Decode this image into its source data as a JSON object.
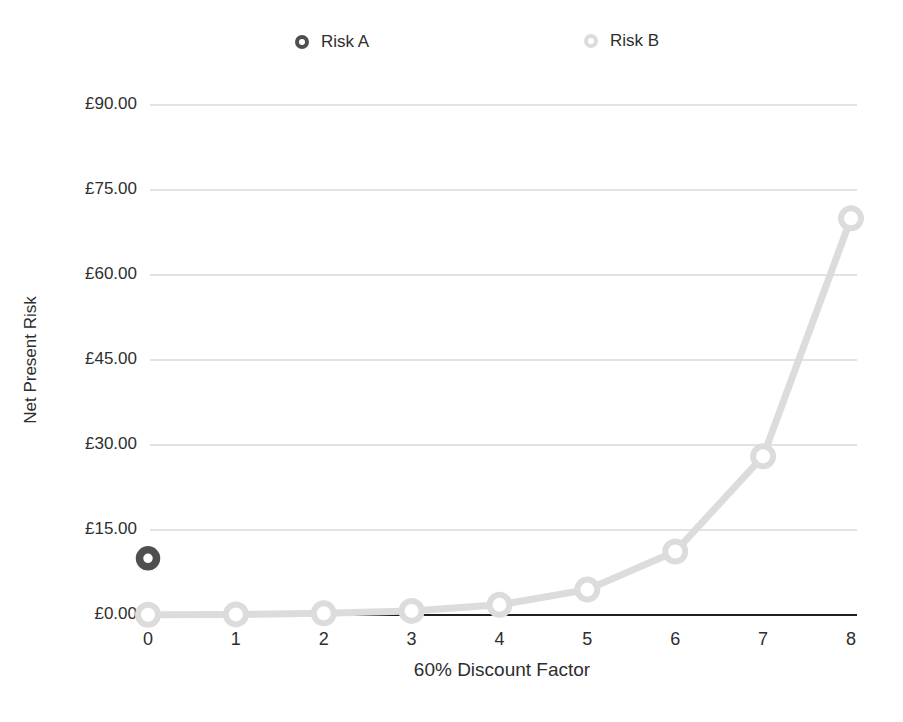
{
  "chart_data": {
    "type": "line",
    "title": "",
    "xlabel": "60% Discount Factor",
    "ylabel": "Net Present Risk",
    "x_ticks": [
      "0",
      "1",
      "2",
      "3",
      "4",
      "5",
      "6",
      "7",
      "8"
    ],
    "y_ticks": [
      "£0.00",
      "£15.00",
      "£30.00",
      "£45.00",
      "£60.00",
      "£75.00",
      "£90.00"
    ],
    "xlim": [
      0,
      8
    ],
    "ylim": [
      0,
      90
    ],
    "y_step": 15,
    "grid": "horizontal",
    "legend_position": "top",
    "series": [
      {
        "name": "Risk A",
        "marker": "ring",
        "line": false,
        "color": "#4f4f4f",
        "points": [
          {
            "x": 0,
            "y": 10
          }
        ]
      },
      {
        "name": "Risk B",
        "marker": "ring",
        "line": true,
        "color": "#dcdcdc",
        "x": [
          0,
          1,
          2,
          3,
          4,
          5,
          6,
          7,
          8
        ],
        "values": [
          0.05,
          0.11,
          0.29,
          0.72,
          1.79,
          4.48,
          11.2,
          28.0,
          70.0
        ]
      }
    ],
    "colors": {
      "background": "#ffffff",
      "grid": "#c7c7c7",
      "axis": "#1f1f1f",
      "text": "#2e2e2e",
      "risk_a": "#4f4f4f",
      "risk_b": "#dcdcdc"
    }
  }
}
